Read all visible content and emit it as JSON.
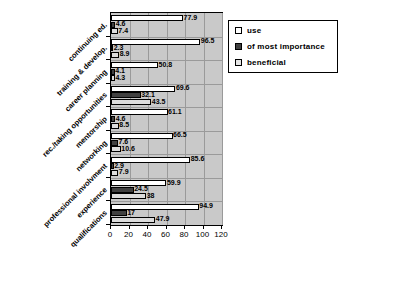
{
  "chart_data": {
    "type": "bar",
    "orientation": "horizontal",
    "title": "",
    "xlabel": "",
    "ylabel": "",
    "xlim": [
      0,
      120
    ],
    "xticks": [
      0,
      20,
      40,
      60,
      80,
      100,
      120
    ],
    "grid": true,
    "legend_position": "right",
    "categories": [
      "continuing ed.",
      "training & develop.",
      "career planning",
      "rec./taking opportunities",
      "mentorship",
      "networking",
      "professional involvment",
      "experience",
      "qualifications"
    ],
    "series": [
      {
        "name": "use",
        "color": "#ffffff",
        "values": [
          77.9,
          96.5,
          50.8,
          69.6,
          61.1,
          66.5,
          85.6,
          59.9,
          94.9
        ],
        "labels": [
          "77.9",
          "96.5",
          "50.8",
          "69.6",
          "61.1",
          "66.5",
          "85.6",
          "59.9",
          "94.9"
        ]
      },
      {
        "name": "of most importance",
        "color": "#404040",
        "values": [
          4.6,
          2.3,
          4.1,
          32.1,
          4.6,
          7.6,
          2.9,
          24.5,
          17
        ],
        "labels": [
          "4.6",
          "2.3",
          "4.1",
          "32.1",
          "4.6",
          "7.6",
          "2.9",
          "24.5",
          "17"
        ]
      },
      {
        "name": "beneficial",
        "color": "#e6e6e6",
        "values": [
          7.4,
          8.9,
          4.3,
          43.5,
          8.5,
          10.6,
          7.9,
          38,
          47.9
        ],
        "labels": [
          "7.4",
          "8.9",
          "4.3",
          "43.5",
          "8.5",
          "10.6",
          "7.9",
          "38",
          "47.9"
        ]
      }
    ]
  },
  "legend": {
    "items": [
      {
        "label": "use"
      },
      {
        "label": "of most importance"
      },
      {
        "label": "beneficial"
      }
    ]
  }
}
